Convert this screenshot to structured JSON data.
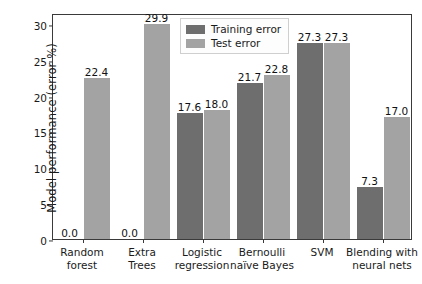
{
  "chart_data": {
    "type": "bar",
    "title": "",
    "xlabel": "",
    "ylabel": "Model performance (error %)",
    "ylim": [
      0,
      31.5
    ],
    "yticks": [
      0,
      5,
      10,
      15,
      20,
      25,
      30
    ],
    "ytick_labels": [
      "0",
      "5",
      "10",
      "15",
      "20",
      "25",
      "30"
    ],
    "grid": false,
    "legend_position": "upper center",
    "categories": [
      "Random forest",
      "Extra Trees",
      "Logistic regression",
      "Bernoulli naïve Bayes",
      "SVM",
      "Blending with neural nets"
    ],
    "category_lines": [
      [
        "Random",
        "forest"
      ],
      [
        "Extra",
        "Trees"
      ],
      [
        "Logistic",
        "regression"
      ],
      [
        "Bernoulli",
        "naïve Bayes"
      ],
      [
        "SVM",
        ""
      ],
      [
        "Blending with",
        "neural nets"
      ]
    ],
    "series": [
      {
        "name": "Training error",
        "color": "#6e6e6e",
        "values": [
          0.0,
          0.0,
          17.6,
          21.7,
          27.3,
          7.3
        ],
        "labels": [
          "0.0",
          "0.0",
          "17.6",
          "21.7",
          "27.3",
          "7.3"
        ]
      },
      {
        "name": "Test error",
        "color": "#a3a3a3",
        "values": [
          22.4,
          29.9,
          18.0,
          22.8,
          27.3,
          17.0
        ],
        "labels": [
          "22.4",
          "29.9",
          "18.0",
          "22.8",
          "27.3",
          "17.0"
        ]
      }
    ]
  },
  "legend": {
    "entries": [
      {
        "label": "Training error",
        "swatch": "train"
      },
      {
        "label": "Test error",
        "swatch": "test"
      }
    ]
  }
}
